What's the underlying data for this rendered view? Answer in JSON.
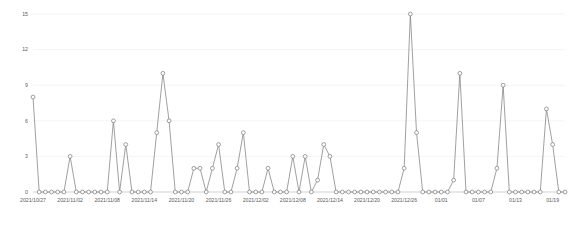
{
  "chart_data": {
    "type": "line",
    "title": "",
    "subtitle": "",
    "xlabel": "",
    "ylabel": "",
    "ylim": [
      0,
      15
    ],
    "yticks": [
      0,
      3,
      6,
      9,
      12,
      15
    ],
    "ytick_labels": [
      "0",
      "3",
      "6",
      "9",
      "12",
      "15"
    ],
    "grid": true,
    "grid_axis": "y",
    "legend": false,
    "legend_position": "none",
    "marker": "open-circle",
    "line_color": "#808080",
    "marker_color": "#808080",
    "grid_color": "#ececec",
    "axis_color": "#bdbdbd",
    "tick_text_color": "#5a5a5a",
    "xtick_labels": [
      "2021/10/27",
      "2021/11/02",
      "2021/11/08",
      "2021/11/14",
      "2021/11/20",
      "2021/11/26",
      "2021/12/02",
      "2021/12/08",
      "2021/12/14",
      "2021/12/20",
      "2021/12/26",
      "01/01",
      "01/07",
      "01/13",
      "01/19"
    ],
    "xtick_indices": [
      0,
      6,
      12,
      18,
      24,
      30,
      36,
      42,
      48,
      54,
      60,
      66,
      72,
      78,
      84
    ],
    "x": [
      "2021/10/27",
      "2021/10/28",
      "2021/10/29",
      "2021/10/30",
      "2021/10/31",
      "2021/11/01",
      "2021/11/02",
      "2021/11/03",
      "2021/11/04",
      "2021/11/05",
      "2021/11/06",
      "2021/11/07",
      "2021/11/08",
      "2021/11/09",
      "2021/11/10",
      "2021/11/11",
      "2021/11/12",
      "2021/11/13",
      "2021/11/14",
      "2021/11/15",
      "2021/11/16",
      "2021/11/17",
      "2021/11/18",
      "2021/11/19",
      "2021/11/20",
      "2021/11/21",
      "2021/11/22",
      "2021/11/23",
      "2021/11/24",
      "2021/11/25",
      "2021/11/26",
      "2021/11/27",
      "2021/11/28",
      "2021/11/29",
      "2021/11/30",
      "2021/12/01",
      "2021/12/02",
      "2021/12/03",
      "2021/12/04",
      "2021/12/05",
      "2021/12/06",
      "2021/12/07",
      "2021/12/08",
      "2021/12/09",
      "2021/12/10",
      "2021/12/11",
      "2021/12/12",
      "2021/12/13",
      "2021/12/14",
      "2021/12/15",
      "2021/12/16",
      "2021/12/17",
      "2021/12/18",
      "2021/12/19",
      "2021/12/20",
      "2021/12/21",
      "2021/12/22",
      "2021/12/23",
      "2021/12/24",
      "2021/12/25",
      "2021/12/26",
      "2021/12/27",
      "2021/12/28",
      "2021/12/29",
      "2021/12/30",
      "2021/12/31",
      "01/01",
      "01/02",
      "01/03",
      "01/04",
      "01/05",
      "01/06",
      "01/07",
      "01/08",
      "01/09",
      "01/10",
      "01/11",
      "01/12",
      "01/13",
      "01/14",
      "01/15",
      "01/16",
      "01/17",
      "01/18",
      "01/19",
      "01/20",
      "01/21"
    ],
    "values": [
      8,
      0,
      0,
      0,
      0,
      0,
      3,
      0,
      0,
      0,
      0,
      0,
      0,
      6,
      0,
      4,
      0,
      0,
      0,
      0,
      5,
      10,
      6,
      0,
      0,
      0,
      2,
      2,
      0,
      2,
      4,
      0,
      0,
      2,
      5,
      0,
      0,
      0,
      2,
      0,
      0,
      0,
      3,
      0,
      3,
      0,
      1,
      4,
      3,
      0,
      0,
      0,
      0,
      0,
      0,
      0,
      0,
      0,
      0,
      0,
      2,
      15,
      5,
      0,
      0,
      0,
      0,
      0,
      1,
      10,
      0,
      0,
      0,
      0,
      0,
      2,
      9,
      0,
      0,
      0,
      0,
      0,
      0,
      7,
      4,
      0,
      0
    ]
  }
}
